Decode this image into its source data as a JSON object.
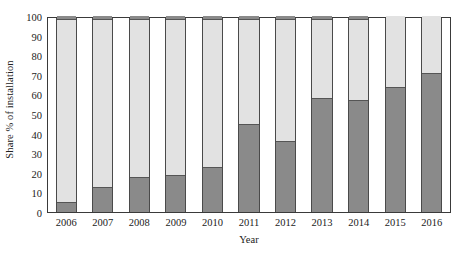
{
  "chart_data": {
    "type": "bar",
    "stacked": true,
    "stack_mode": "percent",
    "title": "",
    "xlabel": "Year",
    "ylabel": "Share % of installation",
    "categories": [
      "2006",
      "2007",
      "2008",
      "2009",
      "2010",
      "2011",
      "2012",
      "2013",
      "2014",
      "2015",
      "2016"
    ],
    "ylim": [
      0,
      100
    ],
    "yticks": [
      0,
      10,
      20,
      30,
      40,
      50,
      60,
      70,
      80,
      90,
      100
    ],
    "ytick_labels": [
      "0",
      "10",
      "20",
      "30",
      "40",
      "50",
      "60",
      "70",
      "80",
      "90",
      "100"
    ],
    "grid": false,
    "legend": "none",
    "series": [
      {
        "name": "bottom-segment",
        "color": "#8a8a8a",
        "values": [
          5,
          13,
          18,
          19,
          23,
          45,
          36,
          58,
          57,
          64,
          71
        ]
      },
      {
        "name": "middle-segment",
        "color": "#e2e2e2",
        "values": [
          93,
          85,
          80,
          79,
          75,
          53,
          62,
          40,
          41,
          36,
          29
        ]
      },
      {
        "name": "top-segment",
        "color": "#8a8a8a",
        "values": [
          2,
          2,
          2,
          2,
          2,
          2,
          2,
          2,
          2,
          0,
          0
        ]
      }
    ],
    "axis": {
      "y_min_label": "0",
      "y_max_label": "100",
      "y_step": 10
    }
  }
}
